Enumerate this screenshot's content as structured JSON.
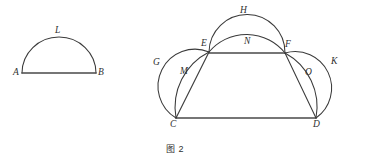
{
  "figure": {
    "caption": "图 2",
    "caption_position": {
      "x": 166,
      "y": 142
    },
    "background_color": "#ffffff",
    "stroke_color": "#3a3a3a",
    "label_color": "#2f2f2f"
  },
  "left_figure": {
    "name": "semicircle-on-AB",
    "points": {
      "A": {
        "x": 22,
        "y": 73
      },
      "B": {
        "x": 96,
        "y": 73
      }
    },
    "labels": [
      {
        "id": "A",
        "text": "A",
        "x": 13,
        "y": 68
      },
      {
        "id": "B",
        "text": "B",
        "x": 98,
        "y": 68
      },
      {
        "id": "L",
        "text": "L",
        "x": 55,
        "y": 26
      }
    ],
    "arcs": [
      {
        "id": "L",
        "from": "A",
        "to": "B",
        "apex_y": 37
      }
    ],
    "segments": [
      {
        "id": "AB",
        "from": "A",
        "to": "B"
      }
    ]
  },
  "right_figure": {
    "name": "lune-construction",
    "points": {
      "C": {
        "x": 176,
        "y": 118
      },
      "D": {
        "x": 316,
        "y": 118
      },
      "E": {
        "x": 209,
        "y": 52
      },
      "F": {
        "x": 285,
        "y": 53
      }
    },
    "labels": [
      {
        "id": "C",
        "text": "C",
        "x": 170,
        "y": 120
      },
      {
        "id": "D",
        "text": "D",
        "x": 313,
        "y": 120
      },
      {
        "id": "E",
        "text": "E",
        "x": 201,
        "y": 39
      },
      {
        "id": "F",
        "text": "F",
        "x": 285,
        "y": 40
      },
      {
        "id": "G",
        "text": "G",
        "x": 153,
        "y": 58
      },
      {
        "id": "H",
        "text": "H",
        "x": 240,
        "y": 6
      },
      {
        "id": "K",
        "text": "K",
        "x": 331,
        "y": 57
      },
      {
        "id": "M",
        "text": "M",
        "x": 180,
        "y": 67
      },
      {
        "id": "N",
        "text": "N",
        "x": 244,
        "y": 37
      },
      {
        "id": "O",
        "text": "O",
        "x": 305,
        "y": 68
      }
    ],
    "arcs": [
      {
        "id": "G",
        "from": "C",
        "to": "E",
        "type": "outer-left-semicircle"
      },
      {
        "id": "M",
        "from": "C",
        "to": "E",
        "type": "inner-left-arc"
      },
      {
        "id": "K",
        "from": "D",
        "to": "F",
        "type": "outer-right-semicircle"
      },
      {
        "id": "O",
        "from": "F",
        "to": "D",
        "type": "inner-right-arc"
      },
      {
        "id": "H",
        "from": "E",
        "to": "F",
        "type": "outer-top-semicircle"
      },
      {
        "id": "N",
        "from": "E",
        "to": "F",
        "type": "inner-top-arc"
      }
    ],
    "segments": [
      {
        "id": "CD",
        "from": "C",
        "to": "D"
      },
      {
        "id": "EF",
        "from": "E",
        "to": "F"
      },
      {
        "id": "CE",
        "from": "C",
        "to": "E"
      },
      {
        "id": "FD",
        "from": "F",
        "to": "D"
      }
    ]
  }
}
